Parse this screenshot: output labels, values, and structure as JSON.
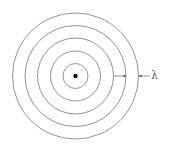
{
  "diagram": {
    "center": {
      "x": 75.5,
      "y": 76
    },
    "radii": [
      12.5,
      25,
      38,
      50.5,
      63
    ],
    "stroke_color": "#888888",
    "source_color": "#111111",
    "source_radius": 2.2,
    "wavelength_label": "λ",
    "wavelength_marker": {
      "inner_arrow": {
        "x1": 113.5,
        "x2": 126.5,
        "y": 76
      },
      "outer_arrow": {
        "x1": 150,
        "x2": 138.5,
        "y": 76
      }
    }
  }
}
